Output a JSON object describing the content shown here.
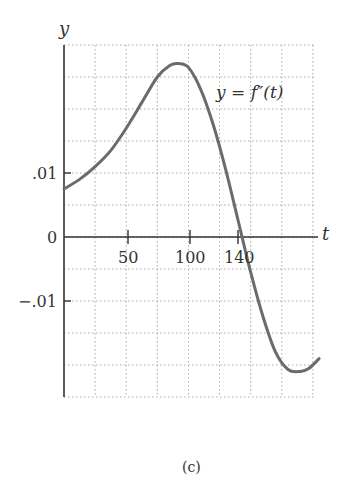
{
  "chart_data": {
    "type": "line",
    "title": "",
    "caption": "(c)",
    "xlabel": "t",
    "ylabel": "y",
    "curve_label": "y = f″(t)",
    "xlim": [
      0,
      205
    ],
    "ylim": [
      -0.025,
      0.025
    ],
    "grid": true,
    "grid_style": "dotted",
    "x_grid_step": 25,
    "y_grid_step": 0.005,
    "x_ticks": [
      {
        "value": 50,
        "label": "50"
      },
      {
        "value": 100,
        "label": "100"
      },
      {
        "value": 140,
        "label": "140"
      }
    ],
    "y_ticks": [
      {
        "value": 0.01,
        "label": ".01"
      },
      {
        "value": 0,
        "label": "0"
      },
      {
        "value": -0.01,
        "label": "−.01"
      }
    ],
    "series": [
      {
        "name": "f''(t)",
        "color": "#6b6b6b",
        "x": [
          0,
          12.5,
          25,
          37.5,
          50,
          62.5,
          75,
          85,
          92,
          100,
          110,
          120,
          130,
          140,
          150,
          160,
          170,
          180,
          190,
          197,
          205
        ],
        "y": [
          0.005,
          0.0065,
          0.0085,
          0.011,
          0.0145,
          0.0185,
          0.0225,
          0.0243,
          0.0246,
          0.024,
          0.0205,
          0.015,
          0.008,
          0.0,
          -0.008,
          -0.015,
          -0.0205,
          -0.0232,
          -0.0235,
          -0.023,
          -0.0215
        ]
      }
    ]
  },
  "labels": {
    "y_axis": "y",
    "x_axis": "t",
    "curve": "y = f″(t)",
    "tick_01": ".01",
    "tick_0": "0",
    "tick_neg01": "−.01",
    "tick_50": "50",
    "tick_100": "100",
    "tick_140": "140",
    "caption": "(c)"
  }
}
